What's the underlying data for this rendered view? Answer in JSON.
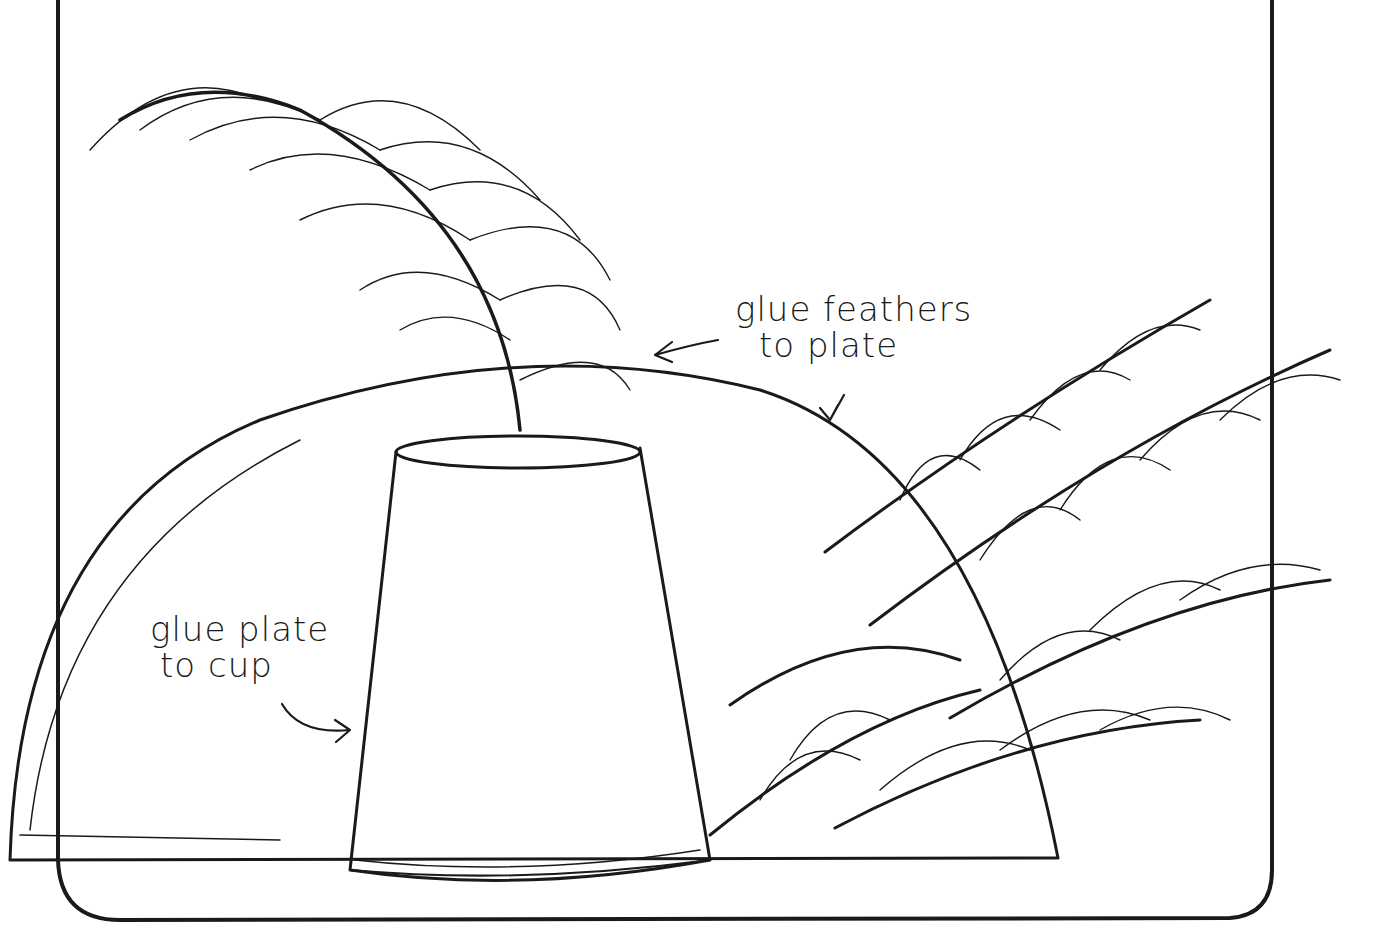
{
  "diagram": {
    "labels": {
      "feathers_to_plate_line1": "glue feathers",
      "feathers_to_plate_line2": "to plate",
      "plate_to_cup_line1": "glue plate",
      "plate_to_cup_line2": "to cup"
    },
    "colors": {
      "ink": "#1a1a1a",
      "paper": "#ffffff"
    }
  }
}
